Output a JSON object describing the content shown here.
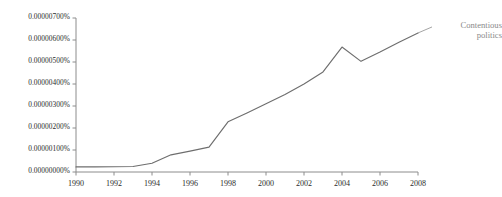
{
  "chart_data": {
    "type": "line",
    "title": "",
    "xlabel": "",
    "ylabel": "",
    "grid": false,
    "legend_position": "right-of-line-end",
    "line_color": "#6e6e6e",
    "axis_color": "#8c8c8c",
    "label_color": "#2b2b2b",
    "series_label_color": "#8a8a8a",
    "x": [
      1990,
      1991,
      1992,
      1993,
      1994,
      1995,
      1996,
      1997,
      1998,
      1999,
      2000,
      2001,
      2002,
      2003,
      2004,
      2005,
      2006,
      2007,
      2008
    ],
    "xlim": [
      1990,
      2008
    ],
    "ylim": [
      0.0,
      7e-06
    ],
    "ytick_values": [
      0.0,
      1e-06,
      2e-06,
      3e-06,
      4e-06,
      5e-06,
      6e-06,
      7e-06
    ],
    "ytick_labels": [
      "0.00000000%",
      "0.00000100%",
      "0.00000200%",
      "0.00000300%",
      "0.00000400%",
      "0.00000500%",
      "0.00000600%",
      "0.00000700%"
    ],
    "xtick_values": [
      1990,
      1992,
      1994,
      1996,
      1998,
      2000,
      2002,
      2004,
      2006,
      2008
    ],
    "xtick_labels": [
      "1990",
      "1992",
      "1994",
      "1996",
      "1998",
      "2000",
      "2002",
      "2004",
      "2006",
      "2008"
    ],
    "series": [
      {
        "name": "Contentious politics",
        "values": [
          2.3e-07,
          2.3e-07,
          2.4e-07,
          2.5e-07,
          4e-07,
          7.8e-07,
          9.5e-07,
          1.13e-06,
          2.28e-06,
          2.68e-06,
          3.1e-06,
          3.52e-06,
          4e-06,
          4.55e-06,
          5.68e-06,
          5.03e-06,
          5.45e-06,
          5.9e-06,
          6.32e-06
        ]
      }
    ]
  },
  "annotations": {
    "series_label": "Contentious\npolitics"
  }
}
